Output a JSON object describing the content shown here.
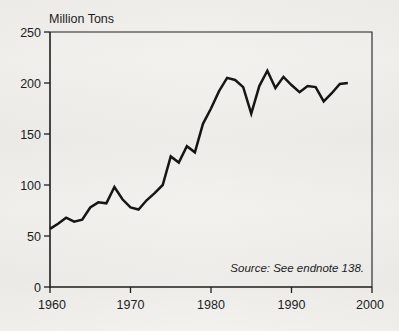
{
  "chart_data": {
    "type": "line",
    "title": "",
    "ylabel": "Million Tons",
    "xlabel": "",
    "ylim": [
      0,
      250
    ],
    "xlim": [
      1960,
      2000
    ],
    "grid": false,
    "legend": null,
    "source_note": "Source: See endnote 138.",
    "yticks": [
      0,
      50,
      100,
      150,
      200,
      250
    ],
    "ytick_labels": [
      "0",
      "50",
      "100",
      "150",
      "200",
      "250"
    ],
    "xticks": [
      1960,
      1970,
      1980,
      1990,
      2000
    ],
    "xtick_labels": [
      "1960",
      "1970",
      "1980",
      "1990",
      "2000"
    ],
    "x": [
      1960,
      1961,
      1962,
      1963,
      1964,
      1965,
      1966,
      1967,
      1968,
      1969,
      1970,
      1971,
      1972,
      1973,
      1974,
      1975,
      1976,
      1977,
      1978,
      1979,
      1980,
      1981,
      1982,
      1983,
      1984,
      1985,
      1986,
      1987,
      1988,
      1989,
      1990,
      1991,
      1992,
      1993,
      1994,
      1995,
      1996,
      1997
    ],
    "values": [
      57,
      62,
      68,
      64,
      66,
      78,
      83,
      82,
      98,
      86,
      78,
      76,
      85,
      92,
      100,
      128,
      122,
      138,
      132,
      160,
      175,
      192,
      205,
      203,
      196,
      170,
      197,
      212,
      195,
      206,
      198,
      191,
      197,
      196,
      182,
      190,
      199,
      200
    ],
    "line_color": "#111111"
  },
  "colors": {
    "background": "#f2f1ee",
    "axis": "#1c1c1c",
    "text": "#1a1a1a",
    "series": "#111111"
  }
}
